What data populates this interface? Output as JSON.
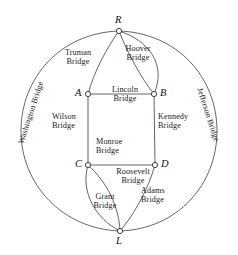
{
  "diagram": {
    "type": "graph-diagram",
    "stroke_color": "#3f3f3f",
    "node_fill": "#ffffff",
    "text_color": "#1a1a1a"
  },
  "vertices": [
    {
      "id": "R",
      "label": "R",
      "x": 119,
      "y": 31
    },
    {
      "id": "A",
      "label": "A",
      "x": 88,
      "y": 94
    },
    {
      "id": "B",
      "label": "B",
      "x": 154,
      "y": 94
    },
    {
      "id": "C",
      "label": "C",
      "x": 88,
      "y": 165
    },
    {
      "id": "D",
      "label": "D",
      "x": 155,
      "y": 165
    },
    {
      "id": "L",
      "label": "L",
      "x": 120,
      "y": 231
    }
  ],
  "bridges": [
    {
      "name": "Washington Bridge",
      "line1": "Washington Bridge",
      "line2": "",
      "from": "R",
      "to": "L",
      "orientation": "vertical-left"
    },
    {
      "name": "Jefferson Bridge",
      "line1": "Jefferson Bridge",
      "line2": "",
      "from": "R",
      "to": "L",
      "orientation": "vertical-right"
    },
    {
      "name": "Truman Bridge",
      "line1": "Truman",
      "line2": "Bridge",
      "from": "R",
      "to": "A"
    },
    {
      "name": "Hoover Bridge",
      "line1": "Hoover",
      "line2": "Bridge",
      "from": "R",
      "to": "B"
    },
    {
      "name": "Lincoln Bridge",
      "line1": "Lincoln",
      "line2": "Bridge",
      "from": "R",
      "to": "B"
    },
    {
      "name": "Wilson Bridge",
      "line1": "Wilson",
      "line2": "Bridge",
      "from": "A",
      "to": "C"
    },
    {
      "name": "Kennedy Bridge",
      "line1": "Kennedy",
      "line2": "Bridge",
      "from": "B",
      "to": "D"
    },
    {
      "name": "Monroe Bridge",
      "line1": "Monroe",
      "line2": "Bridge",
      "from": "A",
      "to": "B"
    },
    {
      "name": "Roosevelt Bridge",
      "line1": "Roosevelt",
      "line2": "Bridge",
      "from": "C",
      "to": "D"
    },
    {
      "name": "Grant Bridge",
      "line1": "Grant",
      "line2": "Bridge",
      "from": "C",
      "to": "L"
    },
    {
      "name": "Adams Bridge",
      "line1": "Adams",
      "line2": "Bridge",
      "from": "D",
      "to": "L"
    }
  ],
  "labels": {
    "washington": {
      "line1": "Washington Bridge"
    },
    "jefferson": {
      "line1": "Jefferson Bridge"
    },
    "truman": {
      "line1": "Truman",
      "line2": "Bridge"
    },
    "hoover": {
      "line1": "Hoover",
      "line2": "Bridge"
    },
    "lincoln": {
      "line1": "Lincoln",
      "line2": "Bridge"
    },
    "wilson": {
      "line1": "Wilson",
      "line2": "Bridge"
    },
    "kennedy": {
      "line1": "Kennedy",
      "line2": "Bridge"
    },
    "monroe": {
      "line1": "Monroe",
      "line2": "Bridge"
    },
    "roosevelt": {
      "line1": "Roosevelt",
      "line2": "Bridge"
    },
    "grant": {
      "line1": "Grant",
      "line2": "Bridge"
    },
    "adams": {
      "line1": "Adams",
      "line2": "Bridge"
    }
  },
  "vertex_labels": {
    "R": "R",
    "A": "A",
    "B": "B",
    "C": "C",
    "D": "D",
    "L": "L"
  }
}
